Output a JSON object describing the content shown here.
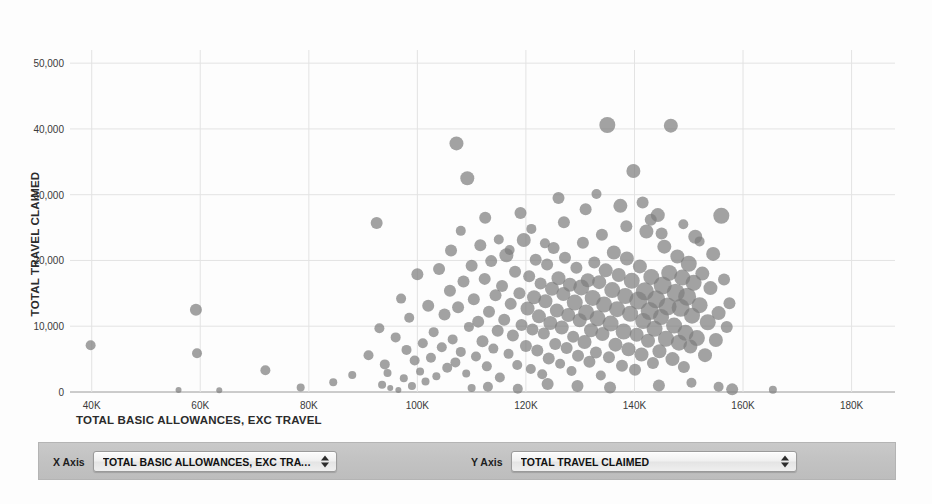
{
  "chart_data": {
    "type": "scatter",
    "title": "",
    "xlabel": "TOTAL BASIC ALLOWANCES, EXC TRAVEL",
    "ylabel": "TOTAL TRAVEL CLAIMED",
    "xlim": [
      36000,
      188000
    ],
    "ylim": [
      0,
      52000
    ],
    "grid": true,
    "legend": "none",
    "point_color": "#7e7e7e",
    "point_opacity": 0.72,
    "xticks": [
      {
        "value": 40000,
        "label": "40K"
      },
      {
        "value": 60000,
        "label": "60K"
      },
      {
        "value": 80000,
        "label": "80K"
      },
      {
        "value": 100000,
        "label": "100K"
      },
      {
        "value": 120000,
        "label": "120K"
      },
      {
        "value": 140000,
        "label": "140K"
      },
      {
        "value": 160000,
        "label": "160K"
      },
      {
        "value": 180000,
        "label": "180K"
      }
    ],
    "yticks": [
      {
        "value": 0,
        "label": "0"
      },
      {
        "value": 10000,
        "label": "10,000"
      },
      {
        "value": 20000,
        "label": "20,000"
      },
      {
        "value": 30000,
        "label": "30,000"
      },
      {
        "value": 40000,
        "label": "40,000"
      },
      {
        "value": 50000,
        "label": "50,000"
      }
    ],
    "size_encoding": "bubble area varies per point",
    "points": [
      [
        39800,
        7100,
        5
      ],
      [
        56000,
        300,
        3
      ],
      [
        59200,
        12500,
        6
      ],
      [
        59400,
        5900,
        5
      ],
      [
        63500,
        250,
        3
      ],
      [
        72000,
        3300,
        5
      ],
      [
        78500,
        700,
        4
      ],
      [
        84500,
        1500,
        4
      ],
      [
        88000,
        2600,
        4
      ],
      [
        91000,
        5600,
        5
      ],
      [
        92500,
        25700,
        6
      ],
      [
        93000,
        9700,
        5
      ],
      [
        93500,
        1100,
        4
      ],
      [
        94000,
        4200,
        5
      ],
      [
        94500,
        2900,
        4
      ],
      [
        95000,
        600,
        3
      ],
      [
        96000,
        8300,
        5
      ],
      [
        96500,
        300,
        3
      ],
      [
        97000,
        14200,
        5
      ],
      [
        97500,
        2100,
        4
      ],
      [
        98000,
        6400,
        5
      ],
      [
        98500,
        11300,
        5
      ],
      [
        99000,
        900,
        4
      ],
      [
        99500,
        4800,
        5
      ],
      [
        100000,
        17900,
        6
      ],
      [
        100500,
        3100,
        4
      ],
      [
        101000,
        7400,
        5
      ],
      [
        101500,
        1600,
        4
      ],
      [
        102000,
        13100,
        6
      ],
      [
        102500,
        5200,
        5
      ],
      [
        103000,
        9100,
        5
      ],
      [
        103500,
        2400,
        4
      ],
      [
        104000,
        18700,
        6
      ],
      [
        104500,
        6800,
        5
      ],
      [
        105000,
        11800,
        6
      ],
      [
        105500,
        3700,
        5
      ],
      [
        106000,
        15400,
        6
      ],
      [
        106200,
        21500,
        6
      ],
      [
        106500,
        8000,
        5
      ],
      [
        107000,
        4500,
        5
      ],
      [
        107200,
        37800,
        7
      ],
      [
        107500,
        12900,
        6
      ],
      [
        108000,
        6100,
        5
      ],
      [
        108500,
        16800,
        6
      ],
      [
        109000,
        2800,
        4
      ],
      [
        109200,
        32500,
        7
      ],
      [
        109500,
        9900,
        5
      ],
      [
        110000,
        19200,
        6
      ],
      [
        110400,
        14100,
        6
      ],
      [
        110800,
        5400,
        5
      ],
      [
        111200,
        10700,
        6
      ],
      [
        111600,
        22300,
        6
      ],
      [
        112000,
        7700,
        6
      ],
      [
        112400,
        17200,
        6
      ],
      [
        112800,
        3900,
        5
      ],
      [
        113200,
        12200,
        6
      ],
      [
        113600,
        19900,
        6
      ],
      [
        114000,
        6600,
        5
      ],
      [
        114400,
        14700,
        6
      ],
      [
        114800,
        9300,
        6
      ],
      [
        115200,
        2200,
        5
      ],
      [
        115600,
        16100,
        6
      ],
      [
        116000,
        11000,
        6
      ],
      [
        116400,
        20800,
        7
      ],
      [
        116800,
        5800,
        5
      ],
      [
        117200,
        13400,
        6
      ],
      [
        117600,
        8600,
        6
      ],
      [
        118000,
        18300,
        6
      ],
      [
        118400,
        4100,
        5
      ],
      [
        118800,
        15000,
        6
      ],
      [
        119200,
        10200,
        6
      ],
      [
        119600,
        23100,
        7
      ],
      [
        120000,
        7000,
        6
      ],
      [
        120300,
        12700,
        7
      ],
      [
        120600,
        17600,
        6
      ],
      [
        120900,
        3500,
        5
      ],
      [
        121200,
        9500,
        6
      ],
      [
        121500,
        14400,
        7
      ],
      [
        121800,
        20100,
        6
      ],
      [
        122100,
        6300,
        6
      ],
      [
        122400,
        11500,
        7
      ],
      [
        122700,
        16500,
        6
      ],
      [
        123000,
        2700,
        5
      ],
      [
        123300,
        8900,
        6
      ],
      [
        123600,
        13800,
        7
      ],
      [
        123900,
        19400,
        6
      ],
      [
        124200,
        5100,
        6
      ],
      [
        124500,
        10500,
        7
      ],
      [
        124800,
        15700,
        7
      ],
      [
        125100,
        21900,
        6
      ],
      [
        125400,
        7300,
        6
      ],
      [
        125700,
        12400,
        7
      ],
      [
        126000,
        17300,
        7
      ],
      [
        126300,
        4300,
        5
      ],
      [
        126600,
        9800,
        7
      ],
      [
        126900,
        14900,
        7
      ],
      [
        127200,
        20400,
        6
      ],
      [
        127500,
        6700,
        6
      ],
      [
        127800,
        11700,
        7
      ],
      [
        128100,
        16300,
        7
      ],
      [
        128400,
        3200,
        5
      ],
      [
        128700,
        8400,
        6
      ],
      [
        129000,
        13600,
        8
      ],
      [
        129300,
        18900,
        6
      ],
      [
        129600,
        5500,
        6
      ],
      [
        129900,
        10900,
        7
      ],
      [
        130200,
        15900,
        8
      ],
      [
        130500,
        22700,
        6
      ],
      [
        130800,
        7600,
        7
      ],
      [
        131100,
        12100,
        8
      ],
      [
        131400,
        17000,
        7
      ],
      [
        131700,
        4600,
        6
      ],
      [
        132000,
        9400,
        7
      ],
      [
        132300,
        14300,
        8
      ],
      [
        132600,
        19700,
        6
      ],
      [
        132900,
        6000,
        6
      ],
      [
        133200,
        11200,
        8
      ],
      [
        133500,
        16700,
        7
      ],
      [
        133800,
        2500,
        5
      ],
      [
        134100,
        8800,
        7
      ],
      [
        134400,
        13300,
        8
      ],
      [
        134700,
        18500,
        7
      ],
      [
        135000,
        40600,
        8
      ],
      [
        135300,
        5300,
        6
      ],
      [
        135600,
        10400,
        8
      ],
      [
        135900,
        15500,
        8
      ],
      [
        136200,
        21200,
        7
      ],
      [
        136500,
        7200,
        7
      ],
      [
        136800,
        12600,
        8
      ],
      [
        137100,
        17800,
        7
      ],
      [
        137400,
        28300,
        7
      ],
      [
        137700,
        4000,
        6
      ],
      [
        138000,
        9200,
        8
      ],
      [
        138300,
        14600,
        8
      ],
      [
        138600,
        20300,
        7
      ],
      [
        138900,
        6500,
        7
      ],
      [
        139200,
        11900,
        8
      ],
      [
        139500,
        16900,
        8
      ],
      [
        139800,
        33600,
        7
      ],
      [
        140100,
        3400,
        6
      ],
      [
        140400,
        8700,
        7
      ],
      [
        140700,
        13900,
        9
      ],
      [
        141000,
        19100,
        7
      ],
      [
        141300,
        5700,
        7
      ],
      [
        141600,
        10800,
        8
      ],
      [
        141900,
        15300,
        9
      ],
      [
        142200,
        24400,
        7
      ],
      [
        142500,
        7800,
        7
      ],
      [
        142800,
        12300,
        9
      ],
      [
        143100,
        17500,
        8
      ],
      [
        143400,
        4400,
        6
      ],
      [
        143700,
        9600,
        8
      ],
      [
        144000,
        14100,
        9
      ],
      [
        144300,
        26900,
        7
      ],
      [
        144600,
        6200,
        7
      ],
      [
        144900,
        11400,
        8
      ],
      [
        145200,
        16200,
        9
      ],
      [
        145500,
        22100,
        7
      ],
      [
        145800,
        8100,
        8
      ],
      [
        146100,
        13000,
        9
      ],
      [
        146400,
        18100,
        8
      ],
      [
        146700,
        40500,
        7
      ],
      [
        147000,
        5000,
        7
      ],
      [
        147300,
        10100,
        8
      ],
      [
        147600,
        15100,
        9
      ],
      [
        147900,
        20600,
        7
      ],
      [
        148200,
        7500,
        8
      ],
      [
        148500,
        12800,
        9
      ],
      [
        148800,
        17400,
        8
      ],
      [
        149100,
        3800,
        6
      ],
      [
        149400,
        9000,
        8
      ],
      [
        149700,
        14500,
        9
      ],
      [
        150000,
        19500,
        8
      ],
      [
        150300,
        6900,
        7
      ],
      [
        150600,
        11600,
        8
      ],
      [
        150900,
        16600,
        8
      ],
      [
        151200,
        23600,
        7
      ],
      [
        151500,
        8200,
        8
      ],
      [
        152000,
        13200,
        8
      ],
      [
        152500,
        18000,
        7
      ],
      [
        153000,
        5600,
        7
      ],
      [
        153500,
        10600,
        8
      ],
      [
        154000,
        15800,
        7
      ],
      [
        154500,
        21000,
        7
      ],
      [
        155000,
        7900,
        7
      ],
      [
        155500,
        12000,
        7
      ],
      [
        156000,
        26800,
        8
      ],
      [
        156500,
        17100,
        6
      ],
      [
        157000,
        9900,
        6
      ],
      [
        157500,
        13500,
        6
      ],
      [
        158000,
        400,
        6
      ],
      [
        165500,
        350,
        4
      ],
      [
        112500,
        26500,
        6
      ],
      [
        119000,
        27200,
        6
      ],
      [
        127000,
        25800,
        6
      ],
      [
        131000,
        27800,
        6
      ],
      [
        138500,
        25200,
        6
      ],
      [
        143000,
        26200,
        6
      ],
      [
        149000,
        25500,
        5
      ],
      [
        121000,
        24800,
        5
      ],
      [
        134000,
        23900,
        6
      ],
      [
        145000,
        24100,
        6
      ],
      [
        115000,
        23200,
        5
      ],
      [
        126000,
        29500,
        6
      ],
      [
        133000,
        30100,
        5
      ],
      [
        141500,
        28800,
        6
      ],
      [
        123500,
        22600,
        5
      ],
      [
        108000,
        24500,
        5
      ],
      [
        117000,
        21600,
        5
      ],
      [
        152000,
        22900,
        5
      ],
      [
        110000,
        600,
        4
      ],
      [
        113000,
        800,
        5
      ],
      [
        118500,
        500,
        5
      ],
      [
        124000,
        1200,
        6
      ],
      [
        129500,
        900,
        6
      ],
      [
        135500,
        700,
        6
      ],
      [
        144500,
        1000,
        6
      ],
      [
        150500,
        1400,
        5
      ],
      [
        155500,
        800,
        5
      ]
    ]
  },
  "controls": {
    "x_axis": {
      "label": "X Axis",
      "value": "TOTAL BASIC ALLOWANCES, EXC TRAVEL",
      "options": [
        "TOTAL BASIC ALLOWANCES, EXC TRAVEL",
        "TOTAL TRAVEL CLAIMED"
      ]
    },
    "y_axis": {
      "label": "Y Axis",
      "value": "TOTAL TRAVEL CLAIMED",
      "options": [
        "TOTAL TRAVEL CLAIMED",
        "TOTAL BASIC ALLOWANCES, EXC TRAVEL"
      ]
    },
    "stepper_icon": "stepper-updown-icon"
  }
}
